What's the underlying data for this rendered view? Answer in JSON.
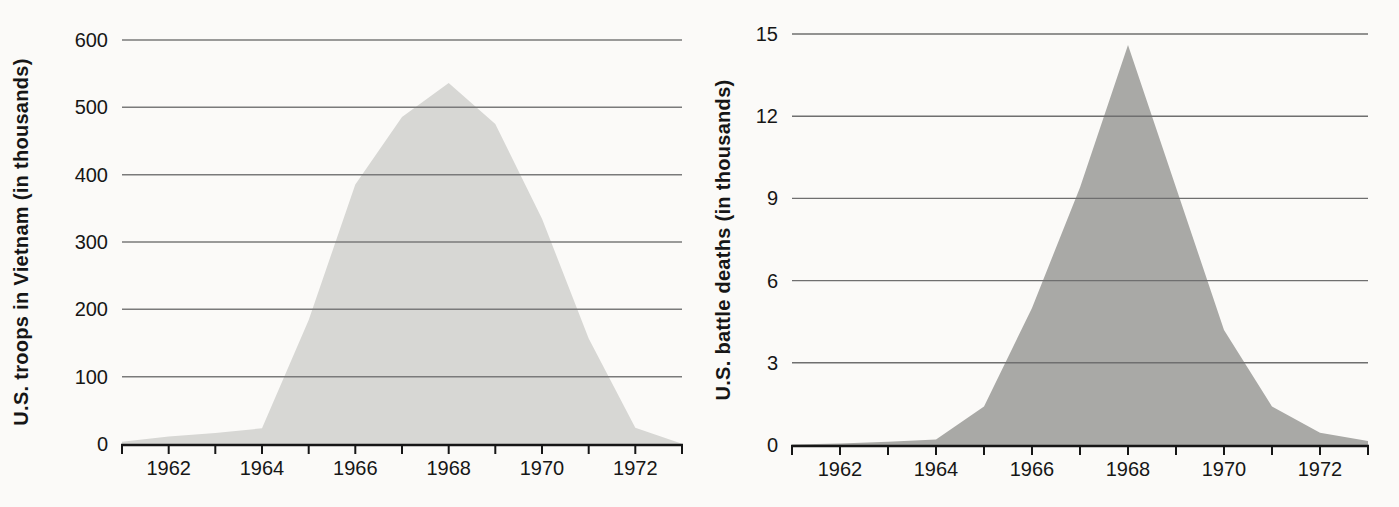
{
  "figure": {
    "background_color": "#fbfaf8"
  },
  "chart_data": [
    {
      "type": "area",
      "title": "",
      "xlabel": "",
      "ylabel": "U.S. troops in Vietnam (in thousands)",
      "x": [
        1961,
        1962,
        1963,
        1964,
        1965,
        1966,
        1967,
        1968,
        1969,
        1970,
        1971,
        1972,
        1973
      ],
      "values": [
        3.2,
        11.3,
        16.3,
        23.3,
        184.3,
        385.3,
        485.6,
        536.1,
        475.2,
        334.6,
        156.8,
        24.2,
        0.5
      ],
      "xlim": [
        1961,
        1973
      ],
      "ylim": [
        0,
        600
      ],
      "yticks": [
        0,
        100,
        200,
        300,
        400,
        500,
        600
      ],
      "xticks_every_year": true,
      "xtick_labels": [
        "1962",
        "1964",
        "1966",
        "1968",
        "1970",
        "1972"
      ],
      "xtick_label_years": [
        1962,
        1964,
        1966,
        1968,
        1970,
        1972
      ],
      "grid": "on",
      "legend": "none",
      "fill_color": "#d7d7d4",
      "grid_color": "#7a7a7a",
      "axis_color": "#161616",
      "text_color": "#161616",
      "area_name": "troops-area"
    },
    {
      "type": "area",
      "title": "",
      "xlabel": "",
      "ylabel": "U.S. battle deaths (in thousands)",
      "x": [
        1961,
        1962,
        1963,
        1964,
        1965,
        1966,
        1967,
        1968,
        1969,
        1970,
        1971,
        1972,
        1973
      ],
      "values": [
        0.02,
        0.05,
        0.12,
        0.2,
        1.4,
        5.0,
        9.4,
        14.6,
        9.4,
        4.2,
        1.4,
        0.45,
        0.15
      ],
      "xlim": [
        1961,
        1973
      ],
      "ylim": [
        0,
        15
      ],
      "yticks": [
        0,
        3,
        6,
        9,
        12,
        15
      ],
      "xticks_every_year": true,
      "xtick_labels": [
        "1962",
        "1964",
        "1966",
        "1968",
        "1970",
        "1972"
      ],
      "xtick_label_years": [
        1962,
        1964,
        1966,
        1968,
        1970,
        1972
      ],
      "grid": "on",
      "legend": "none",
      "fill_color": "#a9a9a6",
      "grid_color": "#6f6f6f",
      "axis_color": "#161616",
      "text_color": "#161616",
      "area_name": "battle-deaths-area"
    }
  ]
}
